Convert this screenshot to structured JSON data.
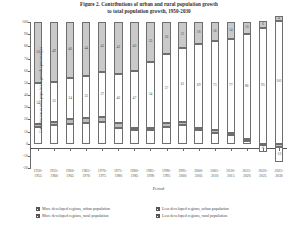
{
  "chart_data": {
    "type": "bar",
    "stacked": true,
    "title": "Figure 2. Contributions of urban and rural population growth",
    "title_line2": "to total population growth, 1950-2030",
    "xlabel": "Period",
    "ylabel": "Contribution to total population growth (percentage)",
    "ylim": [
      -20,
      100
    ],
    "yticks": [
      100,
      90,
      80,
      70,
      60,
      50,
      40,
      30,
      20,
      10,
      0,
      -10,
      -20
    ],
    "ytick_labels": [
      "100",
      "90",
      "80",
      "70",
      "60",
      "50",
      "40",
      "30",
      "20",
      "10",
      "0",
      "-10",
      "-20"
    ],
    "grid": false,
    "legend_position": "bottom",
    "categories": [
      "1950-1955",
      "1955-1960",
      "1960-1965",
      "1965-1970",
      "1970-1975",
      "1975-1980",
      "1980-1985",
      "1985-1990",
      "1990-1995",
      "1995-2000",
      "2000-2005",
      "2005-2010",
      "2010-2015",
      "2015-2020",
      "2020-2025",
      "2025-2030"
    ],
    "category_lines": [
      [
        "1950-",
        "1955"
      ],
      [
        "1955-",
        "1960"
      ],
      [
        "1960-",
        "1965"
      ],
      [
        "1965-",
        "1970"
      ],
      [
        "1970-",
        "1975"
      ],
      [
        "1975-",
        "1980"
      ],
      [
        "1980-",
        "1985"
      ],
      [
        "1985-",
        "1990"
      ],
      [
        "1990-",
        "1995"
      ],
      [
        "1995-",
        "2000"
      ],
      [
        "2000-",
        "2005"
      ],
      [
        "2005-",
        "2010"
      ],
      [
        "2010-",
        "2015"
      ],
      [
        "2015-",
        "2020"
      ],
      [
        "2020-",
        "2025"
      ],
      [
        "2025-",
        "2030"
      ]
    ],
    "series": [
      {
        "name": "Less developed regions, urban population",
        "key": "ldu",
        "color": "#ffffff",
        "values": [
          34,
          33,
          34,
          35,
          37,
          40,
          47,
          54,
          57,
          61,
          69,
          73,
          77,
          86,
          95,
          101
        ]
      },
      {
        "name": "More developed regions, urban population",
        "key": "mdu",
        "color": "#c9c9c9",
        "values": [
          50,
          49,
          46,
          44,
          41,
          43,
          40,
          33,
          26,
          21,
          18,
          16,
          14,
          10,
          6,
          4
        ]
      },
      {
        "name": "Less developed regions, rural population",
        "key": "ldr",
        "color": "#ffffff",
        "values": [
          14,
          15,
          16,
          17,
          18,
          13,
          11,
          11,
          14,
          15,
          11,
          9,
          7,
          2,
          -6,
          -12
        ]
      },
      {
        "name": "More developed regions, rural population",
        "key": "mdr",
        "color": "#bdbdbd",
        "values": [
          2,
          3,
          4,
          4,
          4,
          4,
          2,
          2,
          3,
          3,
          2,
          2,
          2,
          2,
          -1,
          -3
        ]
      }
    ]
  },
  "legend": {
    "items": [
      {
        "label": "More developed regions, urban population",
        "key": "mdu"
      },
      {
        "label": "More developed regions, rural population",
        "key": "mdr"
      },
      {
        "label": "Less developed regions, urban population",
        "key": "ldu"
      },
      {
        "label": "Less developed regions, rural population",
        "key": "ldr"
      }
    ]
  }
}
